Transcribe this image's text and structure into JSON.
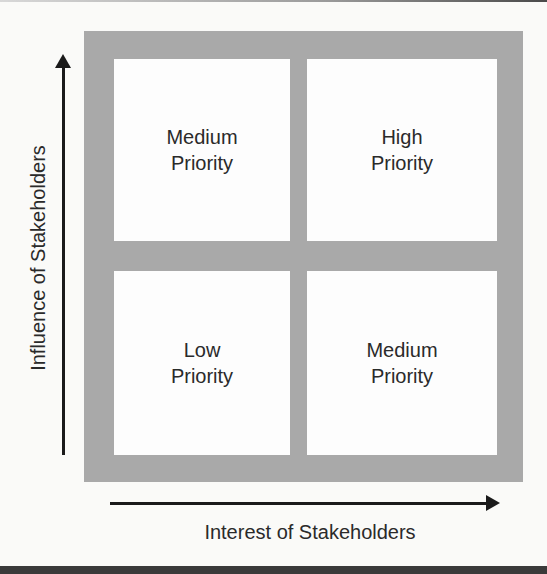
{
  "diagram": {
    "colors": {
      "frame": "#a9a9a9",
      "cell": "#fdfdfd",
      "axis": "#1a1a1a",
      "text": "#2a2a2a"
    },
    "axes": {
      "x_label": "Interest of Stakeholders",
      "y_label": "Influence of Stakeholders"
    },
    "quadrants": {
      "top_left": {
        "line1": "Medium",
        "line2": "Priority"
      },
      "top_right": {
        "line1": "High",
        "line2": "Priority"
      },
      "bottom_left": {
        "line1": "Low",
        "line2": "Priority"
      },
      "bottom_right": {
        "line1": "Medium",
        "line2": "Priority"
      }
    }
  }
}
